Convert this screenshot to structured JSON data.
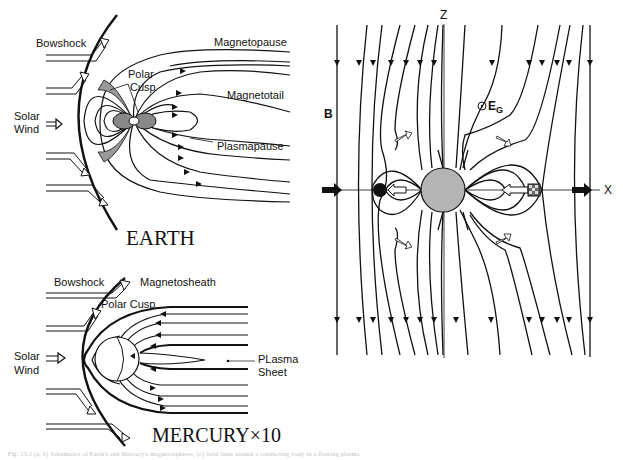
{
  "earth": {
    "title": "EARTH",
    "labels": {
      "bowshock": "Bowshock",
      "magnetopause": "Magnetopause",
      "polar_cusp_1": "Polar",
      "polar_cusp_2": "Cusp",
      "magnetotail": "Magnetotail",
      "solar_wind_1": "Solar",
      "solar_wind_2": "Wind",
      "plasmapause": "Plasmapause"
    }
  },
  "mercury": {
    "title": "MERCURY×10",
    "labels": {
      "bowshock": "Bowshock",
      "magnetosheath": "Magnetosheath",
      "polar_cusp": "Polar Cusp",
      "solar_wind_1": "Solar",
      "solar_wind_2": "Wind",
      "plasma_sheet_1": "PLasma",
      "plasma_sheet_2": "Sheet"
    }
  },
  "field_diagram": {
    "axis_z": "Z",
    "axis_x": "X",
    "field_label": "B",
    "electric_field_label": "E",
    "electric_field_sub": "G",
    "colors": {
      "planet_fill": "#b4b4b4",
      "line": "#111111"
    }
  },
  "caption": "Fig. 13.1  (a, b) Schematics of Earth's and Mercury's magnetospheres; (c) field lines around a conducting body in a flowing plasma"
}
